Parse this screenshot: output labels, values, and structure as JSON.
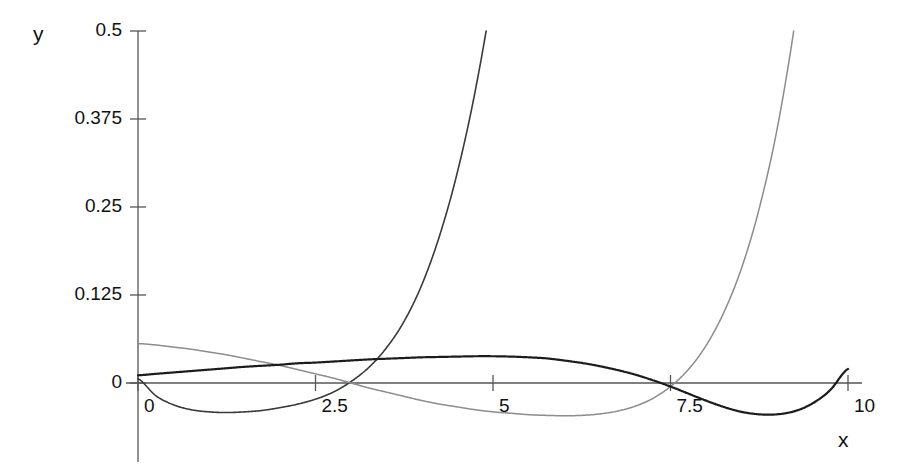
{
  "chart_data": {
    "type": "line",
    "title": "",
    "subtitle": "",
    "xlabel": "x",
    "ylabel": "y",
    "xlim": [
      -0.35,
      10.4
    ],
    "ylim": [
      -0.055,
      0.5
    ],
    "xticks": [
      0,
      2.5,
      5,
      7.5,
      10
    ],
    "xticklabels": [
      "0",
      "2.5",
      "5",
      "7.5",
      "10"
    ],
    "yticks": [
      0,
      0.125,
      0.25,
      0.375,
      0.5
    ],
    "yticklabels": [
      "0",
      "0.125",
      "0.25",
      "0.375",
      "0.5"
    ],
    "grid": false,
    "legend": null,
    "legend_position": "none",
    "annotations": [],
    "axis_color": "#555555",
    "background": "#ffffff",
    "x": [
      0,
      0.25,
      0.5,
      0.75,
      1,
      1.25,
      1.5,
      1.75,
      2,
      2.25,
      2.5,
      2.75,
      3,
      3.25,
      3.5,
      3.75,
      4,
      4.25,
      4.5,
      4.75,
      5,
      5.25,
      5.5,
      5.75,
      6,
      6.25,
      6.5,
      6.75,
      7,
      7.25,
      7.5,
      7.75,
      8,
      8.25,
      8.5,
      8.75,
      9,
      9.25,
      9.5,
      9.75,
      10
    ],
    "series": [
      {
        "name": "curve-1",
        "color": "#3a3a3a",
        "width": 1.6,
        "values": [
          0.006,
          -0.018,
          -0.031,
          -0.038,
          -0.041,
          -0.042,
          -0.041,
          -0.039,
          -0.035,
          -0.03,
          -0.023,
          -0.013,
          0.002,
          0.022,
          0.05,
          0.088,
          0.14,
          0.21,
          0.3,
          0.415,
          0.56,
          0.74,
          0.96,
          1.24,
          1.57,
          1.97,
          2.45,
          3.03,
          3.72,
          4.54,
          5.5,
          6.64,
          7.97,
          9.53,
          11.35,
          13.46,
          15.9,
          18.72,
          21.97,
          25.7,
          30.0
        ]
      },
      {
        "name": "curve-2",
        "color": "#8c8c8c",
        "width": 1.5,
        "values": [
          0.056,
          0.054,
          0.051,
          0.048,
          0.044,
          0.04,
          0.035,
          0.03,
          0.025,
          0.019,
          0.013,
          0.007,
          0.0,
          -0.007,
          -0.013,
          -0.019,
          -0.025,
          -0.03,
          -0.034,
          -0.038,
          -0.041,
          -0.043,
          -0.045,
          -0.046,
          -0.0465,
          -0.046,
          -0.044,
          -0.04,
          -0.033,
          -0.022,
          -0.005,
          0.019,
          0.053,
          0.1,
          0.163,
          0.248,
          0.36,
          0.51,
          0.7,
          0.95,
          1.27
        ]
      },
      {
        "name": "curve-3",
        "color": "#1c1c1c",
        "width": 2.2,
        "values": [
          0.011,
          0.013,
          0.015,
          0.017,
          0.019,
          0.021,
          0.023,
          0.0245,
          0.026,
          0.028,
          0.029,
          0.0305,
          0.032,
          0.0335,
          0.0345,
          0.0355,
          0.0365,
          0.037,
          0.0375,
          0.038,
          0.038,
          0.0375,
          0.0365,
          0.035,
          0.032,
          0.0285,
          0.024,
          0.0185,
          0.012,
          0.004,
          -0.005,
          -0.015,
          -0.025,
          -0.034,
          -0.041,
          -0.0445,
          -0.0445,
          -0.04,
          -0.029,
          -0.01,
          0.02
        ]
      }
    ]
  },
  "axes": {
    "ylabel_text": "y",
    "xlabel_text": "x"
  }
}
